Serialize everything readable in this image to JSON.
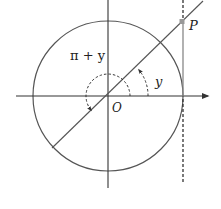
{
  "diagram": {
    "colors": {
      "stroke": "#333333",
      "tangent": "#888888",
      "point": "#999999",
      "dashed": "#333333"
    },
    "geometry": {
      "origin": [
        108,
        96
      ],
      "radius": 75,
      "x_axis": {
        "from": [
          16,
          96
        ],
        "to": [
          208,
          96
        ]
      },
      "y_axis": {
        "from": [
          108,
          0
        ],
        "to": [
          108,
          188
        ]
      },
      "terminal_line": {
        "from": [
          52,
          148
        ],
        "to": [
          203,
          1
        ]
      },
      "tangent_solid": {
        "x": 183,
        "from_y": 22,
        "to_y": 96
      },
      "tangent_dashed_top": {
        "x": 183,
        "from_y": 0,
        "to_y": 20
      },
      "tangent_dashed_bottom": {
        "x": 183,
        "from_y": 98,
        "to_y": 184
      },
      "point_P": [
        182,
        22
      ],
      "arc_y_radius": 40,
      "arc_pi_plus_y_radius": 22
    },
    "labels": {
      "point_P": "P",
      "origin": "O",
      "angle_y": "y",
      "angle_pi_plus_y": "π + y"
    }
  }
}
